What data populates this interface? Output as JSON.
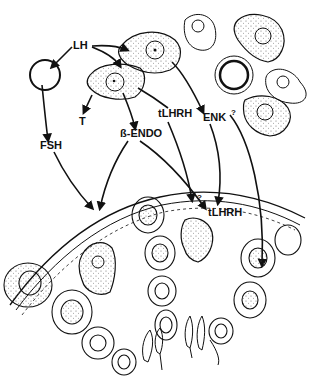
{
  "diagram": {
    "type": "cell-hormone-signaling-illustration",
    "labels": {
      "lh": "LH",
      "t": "T",
      "fsh": "FSH",
      "beta_endo": "ß-ENDO",
      "tlhrh_upper": "tLHRH",
      "enk": "ENK",
      "enk_question": "?",
      "tlhrh_lower": "tLHRH",
      "lower_question": "?"
    },
    "colors": {
      "ink": "#111111",
      "background": "#ffffff",
      "stipple": "#555555"
    }
  }
}
